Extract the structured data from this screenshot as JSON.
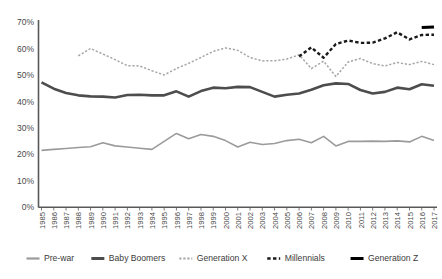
{
  "chart_data": {
    "type": "line",
    "title": "",
    "xlabel": "",
    "ylabel": "",
    "ylim": [
      0,
      0.7
    ],
    "ytick_labels": [
      "0%",
      "10%",
      "20%",
      "30%",
      "40%",
      "50%",
      "60%",
      "70%"
    ],
    "ytick_values": [
      0,
      0.1,
      0.2,
      0.3,
      0.4,
      0.5,
      0.6,
      0.7
    ],
    "grid": false,
    "legend_position": "bottom",
    "categories": [
      "1985",
      "1986",
      "1987",
      "1988",
      "1989",
      "1990",
      "1991",
      "1992",
      "1993",
      "1994",
      "1995",
      "1996",
      "1997",
      "1998",
      "1999",
      "2000",
      "2001",
      "2002",
      "2003",
      "2004",
      "2005",
      "2006",
      "2007",
      "2008",
      "2009",
      "2010",
      "2011",
      "2012",
      "2013",
      "2014",
      "2015",
      "2016",
      "2017"
    ],
    "series": [
      {
        "name": "Pre-war",
        "color": "#9b9b9b",
        "style": "solid",
        "width": 1.6,
        "start_year": "1985",
        "values": [
          0.215,
          0.219,
          0.222,
          0.226,
          0.229,
          0.244,
          0.232,
          0.228,
          0.223,
          0.219,
          0.249,
          0.279,
          0.259,
          0.275,
          0.268,
          0.252,
          0.228,
          0.246,
          0.237,
          0.241,
          0.252,
          0.257,
          0.244,
          0.268,
          0.232,
          0.249,
          0.249,
          0.25,
          0.249,
          0.251,
          0.247,
          0.268,
          0.252
        ]
      },
      {
        "name": "Baby Boomers",
        "color": "#4d4d4d",
        "style": "solid",
        "width": 2.6,
        "start_year": "1985",
        "values": [
          0.472,
          0.448,
          0.432,
          0.423,
          0.419,
          0.418,
          0.415,
          0.424,
          0.425,
          0.423,
          0.423,
          0.438,
          0.418,
          0.439,
          0.452,
          0.45,
          0.455,
          0.454,
          0.436,
          0.418,
          0.425,
          0.43,
          0.444,
          0.461,
          0.468,
          0.466,
          0.443,
          0.43,
          0.436,
          0.452,
          0.446,
          0.465,
          0.459
        ]
      },
      {
        "name": "Generation X",
        "color": "#a6a6a6",
        "style": "dashed-thin",
        "width": 1.5,
        "start_year": "1988",
        "values": [
          null,
          null,
          null,
          0.572,
          0.6,
          0.579,
          0.558,
          0.535,
          0.534,
          0.516,
          0.5,
          0.524,
          0.544,
          0.566,
          0.589,
          0.602,
          0.593,
          0.566,
          0.553,
          0.554,
          0.56,
          0.576,
          0.524,
          0.552,
          0.494,
          0.549,
          0.562,
          0.543,
          0.534,
          0.547,
          0.539,
          0.551,
          0.539
        ]
      },
      {
        "name": "Millennials",
        "color": "#1a1a1a",
        "style": "dashed-thick",
        "width": 2.4,
        "start_year": "2006",
        "values": [
          null,
          null,
          null,
          null,
          null,
          null,
          null,
          null,
          null,
          null,
          null,
          null,
          null,
          null,
          null,
          null,
          null,
          null,
          null,
          null,
          null,
          0.57,
          0.604,
          0.565,
          0.617,
          0.63,
          0.621,
          0.622,
          0.638,
          0.661,
          0.634,
          0.651,
          0.652
        ]
      },
      {
        "name": "Generation Z",
        "color": "#000000",
        "style": "solid",
        "width": 3.0,
        "start_year": "2016",
        "values": [
          null,
          null,
          null,
          null,
          null,
          null,
          null,
          null,
          null,
          null,
          null,
          null,
          null,
          null,
          null,
          null,
          null,
          null,
          null,
          null,
          null,
          null,
          null,
          null,
          null,
          null,
          null,
          null,
          null,
          null,
          null,
          0.679,
          0.681
        ]
      }
    ]
  },
  "legend": {
    "items": [
      {
        "label": "Pre-war",
        "color": "#9b9b9b",
        "style": "solid",
        "width": 2.2
      },
      {
        "label": "Baby Boomers",
        "color": "#4d4d4d",
        "style": "solid",
        "width": 3.0
      },
      {
        "label": "Generation X",
        "color": "#a6a6a6",
        "style": "dashed-thin",
        "width": 1.8
      },
      {
        "label": "Millennials",
        "color": "#1a1a1a",
        "style": "dashed-thick",
        "width": 2.6
      },
      {
        "label": "Generation Z",
        "color": "#000000",
        "style": "solid",
        "width": 3.0
      }
    ]
  },
  "caption": {
    "text": ""
  }
}
